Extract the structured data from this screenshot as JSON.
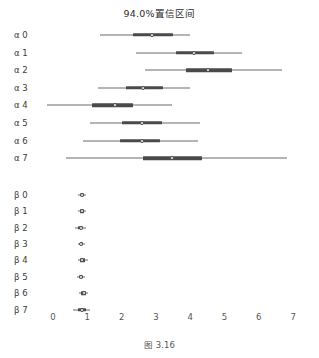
{
  "chart": {
    "title": "94.0%置信区间",
    "caption": "图 3.16"
  },
  "chart_data": {
    "type": "forest",
    "title": "94.0%置信区间",
    "caption": "图 3.16",
    "xlabel": "",
    "ylabel": "",
    "xlim": [
      -0.2,
      7.3
    ],
    "xticks": [
      0,
      1,
      2,
      3,
      4,
      5,
      6,
      7
    ],
    "xticklabels": [
      "0",
      "1",
      "2",
      "3",
      "4",
      "5",
      "6",
      "7"
    ],
    "grid": false,
    "legend": false,
    "credible_level": "94.0%",
    "point_estimate": "median",
    "colors": {
      "line": "#6b6b6b",
      "bar": "#4a4a4a",
      "marker_face": "#ffffff",
      "marker_edge": "#4a4a4a",
      "text": "#3a3a3a"
    },
    "rows": [
      {
        "label": "α 0",
        "hdi_low": 1.37,
        "hdi_high": 4.0,
        "iqr_low": 2.33,
        "iqr_high": 3.5,
        "point": 2.89
      },
      {
        "label": "α 1",
        "hdi_low": 2.42,
        "hdi_high": 5.51,
        "iqr_low": 3.59,
        "iqr_high": 4.69,
        "point": 4.11
      },
      {
        "label": "α 2",
        "hdi_low": 2.68,
        "hdi_high": 6.68,
        "iqr_low": 3.88,
        "iqr_high": 5.22,
        "point": 4.52
      },
      {
        "label": "α 3",
        "hdi_low": 1.31,
        "hdi_high": 4.0,
        "iqr_low": 2.13,
        "iqr_high": 3.21,
        "point": 2.62
      },
      {
        "label": "α 4",
        "hdi_low": -0.17,
        "hdi_high": 3.47,
        "iqr_low": 1.14,
        "iqr_high": 2.33,
        "point": 1.81
      },
      {
        "label": "α 5",
        "hdi_low": 1.08,
        "hdi_high": 4.29,
        "iqr_low": 2.01,
        "iqr_high": 3.18,
        "point": 2.59
      },
      {
        "label": "α 6",
        "hdi_low": 0.87,
        "hdi_high": 4.23,
        "iqr_low": 1.95,
        "iqr_high": 3.12,
        "point": 2.59
      },
      {
        "label": "α 7",
        "hdi_low": 0.38,
        "hdi_high": 6.82,
        "iqr_low": 2.62,
        "iqr_high": 4.34,
        "point": 3.47
      },
      {
        "label": "β 0",
        "hdi_low": 0.73,
        "hdi_high": 0.96,
        "iqr_low": 0.79,
        "iqr_high": 0.9,
        "point": 0.84
      },
      {
        "label": "β 1",
        "hdi_low": 0.73,
        "hdi_high": 0.96,
        "iqr_low": 0.79,
        "iqr_high": 0.9,
        "point": 0.84
      },
      {
        "label": "β 2",
        "hdi_low": 0.64,
        "hdi_high": 0.96,
        "iqr_low": 0.73,
        "iqr_high": 0.88,
        "point": 0.81
      },
      {
        "label": "β 3",
        "hdi_low": 0.73,
        "hdi_high": 0.93,
        "iqr_low": 0.78,
        "iqr_high": 0.88,
        "point": 0.83
      },
      {
        "label": "β 4",
        "hdi_low": 0.73,
        "hdi_high": 1.02,
        "iqr_low": 0.79,
        "iqr_high": 0.93,
        "point": 0.86
      },
      {
        "label": "β 5",
        "hdi_low": 0.7,
        "hdi_high": 0.93,
        "iqr_low": 0.76,
        "iqr_high": 0.88,
        "point": 0.82
      },
      {
        "label": "β 6",
        "hdi_low": 0.76,
        "hdi_high": 1.02,
        "iqr_low": 0.82,
        "iqr_high": 0.96,
        "point": 0.89
      },
      {
        "label": "β 7",
        "hdi_low": 0.58,
        "hdi_high": 1.08,
        "iqr_low": 0.73,
        "iqr_high": 0.96,
        "point": 0.84
      }
    ]
  }
}
